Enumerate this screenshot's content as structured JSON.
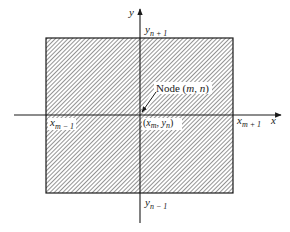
{
  "diagram": {
    "type": "finite-difference grid node with control-volume rectangle",
    "axes": {
      "x_label": "x",
      "y_label": "y"
    },
    "region": {
      "fill_pattern": "diagonal hatch",
      "stroke_color": "#1a1a1a"
    },
    "labels": {
      "y_top": {
        "base": "y",
        "sub": "n + 1"
      },
      "y_bottom": {
        "base": "y",
        "sub": "n − 1"
      },
      "x_left": {
        "base": "x",
        "sub": "m − 1"
      },
      "x_right": {
        "base": "x",
        "sub": "m + 1"
      },
      "center": {
        "open": "(",
        "x": "x",
        "x_sub": "m",
        "comma": ", ",
        "y": "y",
        "y_sub": "n",
        "close": ")"
      },
      "node": {
        "prefix": "Node (",
        "m": "m",
        "comma": ", ",
        "n": "n",
        "suffix": ")"
      }
    }
  }
}
